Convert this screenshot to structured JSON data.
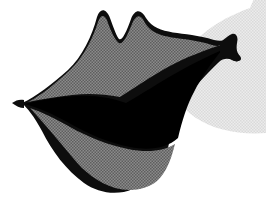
{
  "artwork": {
    "title": "Lips Clip Art Illustration",
    "subject": "open mouth with lips, three-quarter angle",
    "style": "halftone-screened black-and-white clip art",
    "canvas": {
      "width": 266,
      "height": 209,
      "background_color": "#ffffff"
    },
    "palette": {
      "background": "#ffffff",
      "backdrop_blob": "#e3e3e3",
      "lip_fill": "#787878",
      "lip_fill_shadow": "#6b6b6b",
      "outline": "#0d0d0d",
      "mouth_interior": "#000000"
    },
    "shapes": [
      {
        "name": "backdrop-blob",
        "role": "light gray rounded backdrop shape behind the lips at upper right",
        "fill": "#e3e3e3",
        "path": "M 266 -30 L 266 133 C 240 135 214 130 196 118 C 176 105 170 86 178 66 C 188 41 216 20 250 8 Z"
      },
      {
        "name": "lips-outline-body",
        "role": "overall lip silhouette including outer black keyline",
        "fill": "#0d0d0d",
        "path": "M 22 103 C 36 97 52 84 68 70 C 82 57 92 36 97 17 C 100 8 106 8 110 18 C 114 29 117 37 119 39 C 122 41 126 33 131 19 C 135 9 141 9 146 18 C 158 37 183 30 214 40 C 222 42 228 40 231 36 C 235 33 239 36 237 43 C 236 49 237 53 240 56 C 243 60 239 63 233 60 C 228 58 223 58 219 62 C 212 69 200 80 186 99 C 176 113 172 130 168 148 C 163 167 150 181 133 189 C 117 196 98 193 84 183 C 66 170 52 151 42 131 C 34 116 27 108 22 103 Z"
      },
      {
        "name": "upper-lip-fill",
        "role": "gray halftone fill of the upper lip above the mouth opening",
        "fill": "#787878",
        "path": "M 28 102 C 42 95 56 83 71 69 C 84 56 93 38 98 22 C 101 14 105 14 108 23 C 112 34 116 41 119 43 C 123 45 127 36 132 24 C 136 14 141 14 145 23 C 157 42 182 35 212 45 C 218 47 223 46 226 43 C 206 50 186 57 168 67 C 150 77 134 88 120 97 C 104 94 88 93 72 95 C 56 97 41 99 28 102 Z"
      },
      {
        "name": "lower-lip-fill",
        "role": "gray halftone fill of the lower lip below the mouth opening",
        "fill": "#787878",
        "path": "M 30 108 C 42 112 56 119 70 127 C 88 137 108 145 128 149 C 148 153 164 151 175 144 C 171 160 166 173 157 181 C 146 190 130 192 115 188 C 99 183 84 172 73 158 C 58 140 43 122 30 108 Z"
      },
      {
        "name": "mouth-interior",
        "role": "solid black open-mouth interior between the lips",
        "fill": "#000000",
        "path": "M 24 104 C 40 100 58 97 76 96 C 96 95 112 98 126 103 C 142 94 160 82 178 72 C 194 63 208 56 222 50 C 212 62 202 76 194 92 C 187 105 182 121 178 138 C 167 148 150 151 130 147 C 109 143 88 134 69 123 C 53 114 37 107 24 104 Z"
      },
      {
        "name": "left-mouth-corner",
        "role": "sharp pointed left corner of the mouth",
        "fill": "#0d0d0d",
        "path": "M 12 103 C 16 100 20 99 24 100 L 24 108 C 20 108 16 106 12 103 Z"
      },
      {
        "name": "right-mouth-corner",
        "role": "flared T-shaped right corner tip of the mouth",
        "fill": "#0d0d0d",
        "path": "M 220 43 C 224 39 229 35 232 34 C 236 33 238 36 236 42 C 235 48 236 53 239 57 C 241 61 237 63 232 60 C 228 57 224 56 220 57 Z"
      }
    ]
  }
}
